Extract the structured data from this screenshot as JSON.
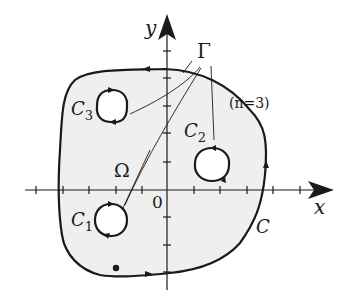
{
  "figure": {
    "type": "multiply-connected-region-diagram",
    "axes": {
      "x_label": "x",
      "y_label": "y",
      "origin_label": "0"
    },
    "region_label": "Ω",
    "boundary_label": "Γ",
    "outer_contour_label": "C",
    "inner_contours": [
      {
        "label": "C",
        "subscript": "1"
      },
      {
        "label": "C",
        "subscript": "2"
      },
      {
        "label": "C",
        "subscript": "3"
      }
    ],
    "annotation": "(n=3)",
    "colors": {
      "region_fill": "#efefef",
      "stroke": "#1a1a1a",
      "background": "#ffffff"
    }
  }
}
